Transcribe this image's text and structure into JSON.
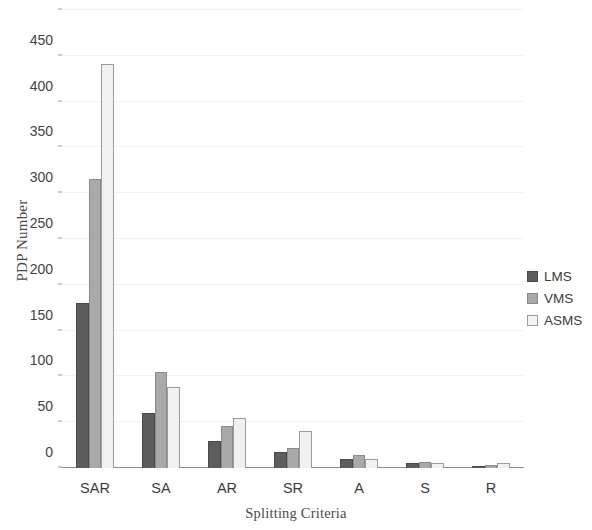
{
  "chart_data": {
    "type": "bar",
    "title": "",
    "xlabel": "Splitting Criteria",
    "ylabel": "PDP Number",
    "categories": [
      "SAR",
      "SA",
      "AR",
      "SR",
      "A",
      "S",
      "R"
    ],
    "series": [
      {
        "name": "LMS",
        "color": "#5d5d5d",
        "values": [
          180,
          60,
          30,
          18,
          10,
          5,
          2
        ]
      },
      {
        "name": "VMS",
        "color": "#a9a9a9",
        "values": [
          316,
          105,
          46,
          22,
          14,
          7,
          3
        ]
      },
      {
        "name": "ASMS",
        "color": "#f1f1f1",
        "values": [
          441,
          88,
          55,
          40,
          10,
          6,
          5
        ]
      }
    ],
    "ylim": [
      0,
      500
    ],
    "ytick_step": 50,
    "yticks": [
      0,
      50,
      100,
      150,
      200,
      250,
      300,
      350,
      400,
      450,
      500
    ],
    "ytick_labels": [
      "0",
      "50",
      "100",
      "150",
      "200",
      "250",
      "300",
      "350",
      "400",
      "450",
      "500"
    ],
    "grid": true,
    "grid_axis": "y",
    "legend_position": "right",
    "background_color": "#ffffff",
    "axis_color": "#8c8c8c",
    "grid_color": "#f2f2f2"
  }
}
